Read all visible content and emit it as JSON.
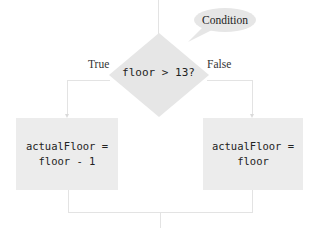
{
  "diagram": {
    "type": "flowchart",
    "callout": {
      "label": "Condition",
      "points_to": "decision"
    },
    "decision": {
      "text": "floor > 13?",
      "shape": "diamond"
    },
    "branches": {
      "true": {
        "label": "True",
        "statement_lines": [
          "actualFloor =",
          "floor - 1"
        ]
      },
      "false": {
        "label": "False",
        "statement_lines": [
          "actualFloor =",
          "floor"
        ]
      }
    },
    "colors": {
      "shape_fill": "#e6e6e6",
      "box_fill": "#ececec",
      "line": "#e3e3e3",
      "text": "#222222",
      "background": "#ffffff"
    }
  }
}
